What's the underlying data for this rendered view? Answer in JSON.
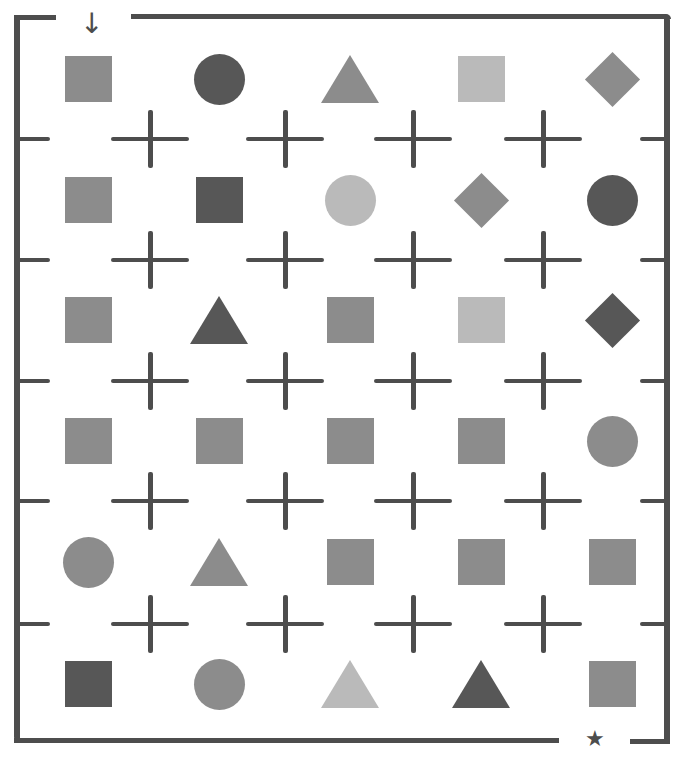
{
  "puzzle": {
    "type": "shape maze",
    "start_marker": "↓",
    "end_marker": "★",
    "colors": {
      "dark": "#575757",
      "medium": "#8c8c8c",
      "light": "#bababa",
      "wall": "#4d4d4d",
      "background": "#ffffff"
    },
    "columns": 5,
    "rows": 6,
    "grid": [
      [
        {
          "shape": "square",
          "tone": "medium"
        },
        {
          "shape": "circle",
          "tone": "dark"
        },
        {
          "shape": "triangle",
          "tone": "medium"
        },
        {
          "shape": "square",
          "tone": "light"
        },
        {
          "shape": "diamond",
          "tone": "medium"
        }
      ],
      [
        {
          "shape": "square",
          "tone": "medium"
        },
        {
          "shape": "square",
          "tone": "dark"
        },
        {
          "shape": "circle",
          "tone": "light"
        },
        {
          "shape": "diamond",
          "tone": "medium"
        },
        {
          "shape": "circle",
          "tone": "dark"
        }
      ],
      [
        {
          "shape": "square",
          "tone": "medium"
        },
        {
          "shape": "triangle",
          "tone": "dark"
        },
        {
          "shape": "square",
          "tone": "medium"
        },
        {
          "shape": "square",
          "tone": "light"
        },
        {
          "shape": "diamond",
          "tone": "dark"
        }
      ],
      [
        {
          "shape": "square",
          "tone": "medium"
        },
        {
          "shape": "square",
          "tone": "medium"
        },
        {
          "shape": "square",
          "tone": "medium"
        },
        {
          "shape": "square",
          "tone": "medium"
        },
        {
          "shape": "circle",
          "tone": "medium"
        }
      ],
      [
        {
          "shape": "circle",
          "tone": "medium"
        },
        {
          "shape": "triangle",
          "tone": "medium"
        },
        {
          "shape": "square",
          "tone": "medium"
        },
        {
          "shape": "square",
          "tone": "medium"
        },
        {
          "shape": "square",
          "tone": "medium"
        }
      ],
      [
        {
          "shape": "square",
          "tone": "dark"
        },
        {
          "shape": "circle",
          "tone": "medium"
        },
        {
          "shape": "triangle",
          "tone": "light"
        },
        {
          "shape": "triangle",
          "tone": "dark"
        },
        {
          "shape": "square",
          "tone": "medium"
        }
      ]
    ]
  }
}
